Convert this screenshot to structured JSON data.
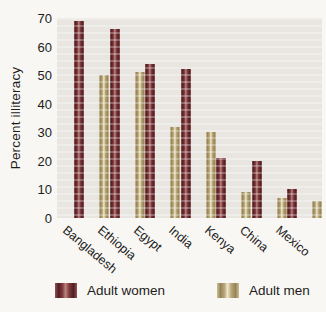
{
  "chart_data": {
    "type": "bar",
    "title": "",
    "xlabel": "",
    "ylabel": "Percent illiteracy",
    "categories": [
      "Bangladesh",
      "Ethiopia",
      "Egypt",
      "India",
      "Kenya",
      "China",
      "Mexico"
    ],
    "series": [
      {
        "name": "Adult women",
        "values": [
          69,
          66,
          54,
          52,
          21,
          20,
          10
        ],
        "colors": {
          "edge": "#96524f",
          "dark": "#4e2026",
          "base": "#823a3f",
          "light": "#b8867d"
        }
      },
      {
        "name": "Adult men",
        "values": [
          50,
          51,
          32,
          30,
          9,
          7,
          6
        ],
        "colors": {
          "edge": "#cdbf96",
          "dark": "#958455",
          "base": "#b9a87d",
          "light": "#f0e8c9"
        }
      }
    ],
    "ylim": [
      0,
      70
    ],
    "yticks": [
      0,
      10,
      20,
      30,
      40,
      50,
      60,
      70
    ],
    "grid": false,
    "legend_position": "bottom",
    "plot_bg": "#e9e6e1",
    "page_bg": "#f9f7f3",
    "text_color": "#1c1c1c"
  }
}
